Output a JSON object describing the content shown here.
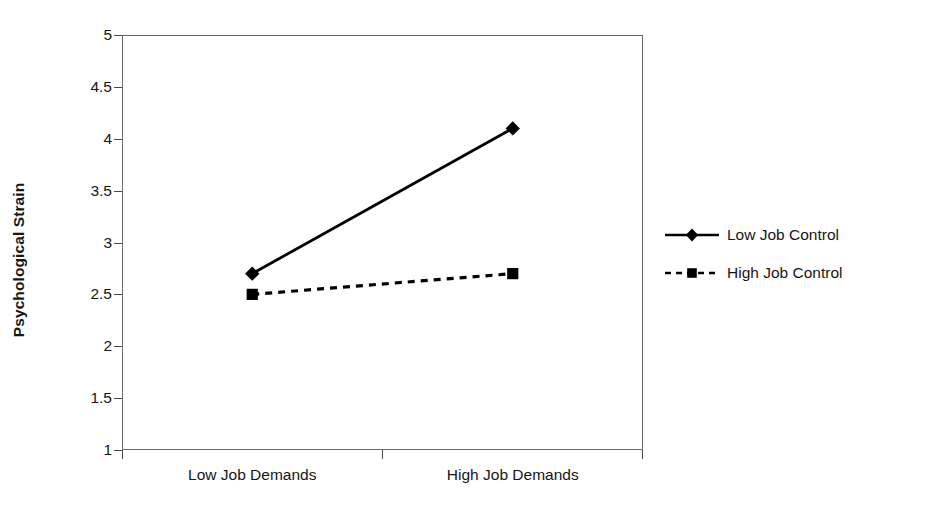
{
  "chart_data": {
    "type": "line",
    "title": "",
    "subtitle": "",
    "xlabel": "",
    "ylabel": "Psychological Strain",
    "categories": [
      "Low Job Demands",
      "High Job Demands"
    ],
    "series": [
      {
        "name": "Low Job Control",
        "values": [
          2.7,
          4.1
        ],
        "marker": "diamond",
        "linestyle": "solid",
        "color": "#000000"
      },
      {
        "name": "High Job Control",
        "values": [
          2.5,
          2.7
        ],
        "marker": "square",
        "linestyle": "dashed",
        "color": "#000000"
      }
    ],
    "ylim": [
      1,
      5
    ],
    "ytick_values": [
      1,
      1.5,
      2,
      2.5,
      3,
      3.5,
      4,
      4.5,
      5
    ],
    "ytick_labels": [
      "1",
      "1.5",
      "2",
      "2.5",
      "3",
      "3.5",
      "4",
      "4.5",
      "5"
    ],
    "grid": false,
    "legend_position": "right",
    "plot_border": true,
    "background_color": "#ffffff",
    "axis_color": "#6b6b6b",
    "text_color": "#161616"
  },
  "legend": {
    "entries": [
      {
        "label": "Low Job Control",
        "marker": "diamond-marker-icon",
        "linestyle": "solid"
      },
      {
        "label": "High Job Control",
        "marker": "square-marker-icon",
        "linestyle": "dashed"
      }
    ]
  }
}
